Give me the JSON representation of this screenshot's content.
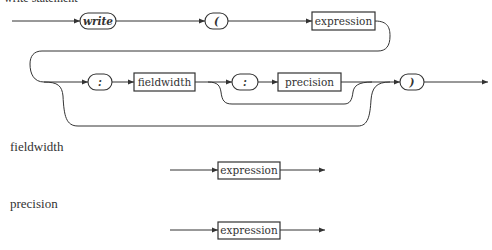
{
  "diagram": {
    "title": "write statement",
    "main": {
      "terminals": [
        {
          "id": "write",
          "label": "write"
        },
        {
          "id": "lparen",
          "label": "("
        },
        {
          "id": "colon1",
          "label": ":"
        },
        {
          "id": "colon2",
          "label": ":"
        },
        {
          "id": "rparen",
          "label": ")"
        }
      ],
      "nonterminals": [
        {
          "id": "expression",
          "label": "expression"
        },
        {
          "id": "fieldwidth",
          "label": "fieldwidth"
        },
        {
          "id": "precision",
          "label": "precision"
        }
      ]
    },
    "rules": [
      {
        "name": "fieldwidth",
        "nonterminal": "expression"
      },
      {
        "name": "precision",
        "nonterminal": "expression"
      }
    ]
  }
}
